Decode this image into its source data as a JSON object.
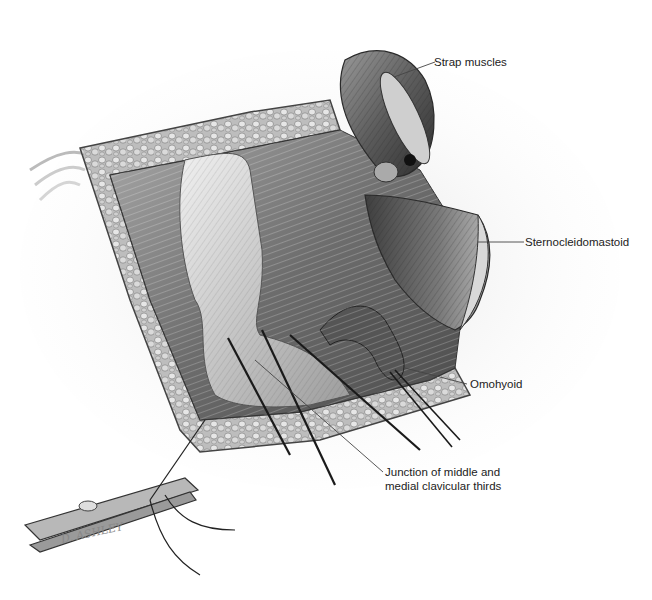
{
  "figure": {
    "type": "surgical-illustration",
    "signature": "D. ASHLEY"
  },
  "labels": {
    "strap_muscles": "Strap muscles",
    "sternocleidomastoid": "Sternocleidomastoid",
    "omohyoid": "Omohyoid",
    "junction_line1": "Junction of middle and",
    "junction_line2": "medial clavicular thirds"
  },
  "colors": {
    "background": "#ffffff",
    "label_text": "#222222",
    "leader_line": "#444444",
    "tissue_dark": "#3a3a3a",
    "tissue_mid": "#8a8a8a",
    "tissue_light": "#d8d8d8",
    "fat_lobules": "#c9c9c9"
  }
}
